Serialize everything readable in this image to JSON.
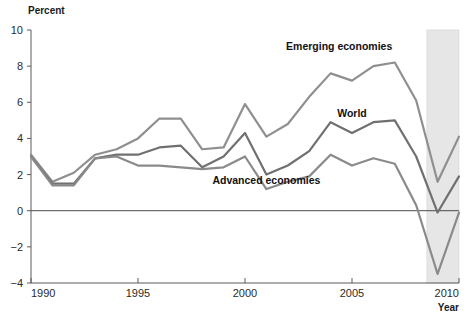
{
  "chart_data": {
    "type": "line",
    "title": "",
    "subtitle": "",
    "ylabel": "Percent",
    "xlabel": "Year",
    "xlim": [
      1990,
      2010
    ],
    "ylim": [
      -4,
      10
    ],
    "ytick_labels": [
      "10",
      "8",
      "6",
      "4",
      "2",
      "0",
      "−2",
      "−4"
    ],
    "yticks": [
      10,
      8,
      6,
      4,
      2,
      0,
      -2,
      -4
    ],
    "xtick_labels": [
      "1990",
      "1995",
      "2000",
      "2005",
      "2010"
    ],
    "xticks": [
      1990,
      1995,
      2000,
      2005,
      2010
    ],
    "grid": false,
    "zero_line": true,
    "legend_position": "inline-annotations",
    "shaded_region": {
      "label": "",
      "x_start": 2008.5,
      "x_end": 2010.5,
      "color": "#e6e6e6"
    },
    "x": [
      1990,
      1991,
      1992,
      1993,
      1994,
      1995,
      1996,
      1997,
      1998,
      1999,
      2000,
      2001,
      2002,
      2003,
      2004,
      2005,
      2006,
      2007,
      2008,
      2009,
      2010
    ],
    "series": [
      {
        "name": "Emerging economies",
        "color": "#8f8f8f",
        "label_x": 2004.4,
        "label_y": 8.9,
        "values": [
          3.1,
          1.6,
          2.1,
          3.1,
          3.4,
          4.0,
          5.1,
          5.1,
          3.4,
          3.5,
          5.9,
          4.1,
          4.8,
          6.3,
          7.6,
          7.2,
          8.0,
          8.2,
          6.1,
          1.6,
          4.1
        ]
      },
      {
        "name": "World",
        "color": "#707070",
        "label_x": 2005.0,
        "label_y": 5.2,
        "values": [
          3.0,
          1.5,
          1.5,
          2.9,
          3.1,
          3.1,
          3.5,
          3.6,
          2.4,
          3.0,
          4.3,
          2.0,
          2.5,
          3.3,
          4.9,
          4.3,
          4.9,
          5.0,
          3.0,
          -0.1,
          1.9
        ]
      },
      {
        "name": "Advanced economies",
        "color": "#8a8a8a",
        "label_x": 2001.0,
        "label_y": 1.5,
        "values": [
          3.0,
          1.4,
          1.4,
          2.9,
          3.0,
          2.5,
          2.5,
          2.4,
          2.3,
          2.4,
          3.0,
          1.2,
          1.6,
          1.9,
          3.1,
          2.5,
          2.9,
          2.6,
          0.3,
          -3.5,
          -0.1
        ]
      }
    ]
  }
}
